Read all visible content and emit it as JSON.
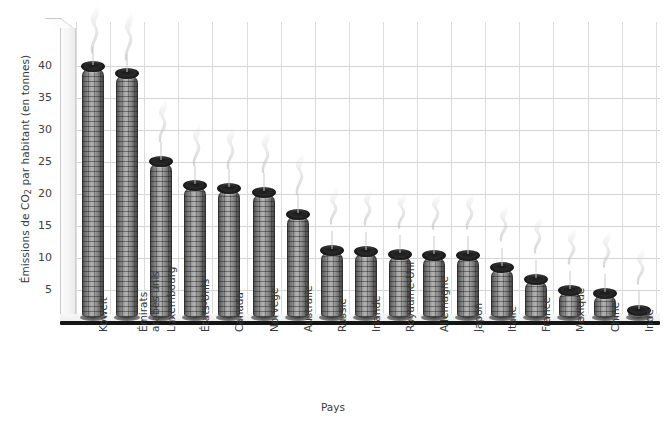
{
  "chart_data": {
    "type": "bar",
    "title": "",
    "xlabel": "Pays",
    "ylabel": "Émissions de CO2 par habitant (en tonnes)",
    "ylabel_parts": {
      "pre": "Émissions de CO",
      "sub": "2",
      "post": " par habitant (en tonnes)"
    },
    "categories": [
      "Koweït",
      "Émirats arabes unis",
      "Luxembourg",
      "États-Unis",
      "Canada",
      "Norvège",
      "Australie",
      "Russie",
      "Irlande",
      "Royaume-Uni",
      "Allemagne",
      "Japon",
      "Italie",
      "France",
      "Mexique",
      "Chine",
      "Inde"
    ],
    "values": [
      39,
      38,
      24.2,
      20.5,
      20,
      19.3,
      15.9,
      10.3,
      10.2,
      9.7,
      9.6,
      9.5,
      7.6,
      5.8,
      4.1,
      3.6,
      1.0
    ],
    "ylim": [
      0,
      42
    ],
    "yticks": [
      5,
      10,
      15,
      20,
      25,
      30,
      35,
      40
    ],
    "ytick_labels": [
      "5",
      "10",
      "15",
      "20",
      "25",
      "30",
      "35",
      "40"
    ],
    "grid": "horizontal-and-vertical",
    "legend": "none",
    "bar_style": "3d-smokestack-cylinder",
    "colors": {
      "bar_light": "#b3b3b3",
      "bar_dark": "#3f3f3f",
      "bar_cap": "#151515",
      "gridline": "#d4d4d4",
      "baseline": "#151515",
      "text": "#3a3a3a",
      "background": "#ffffff"
    }
  }
}
